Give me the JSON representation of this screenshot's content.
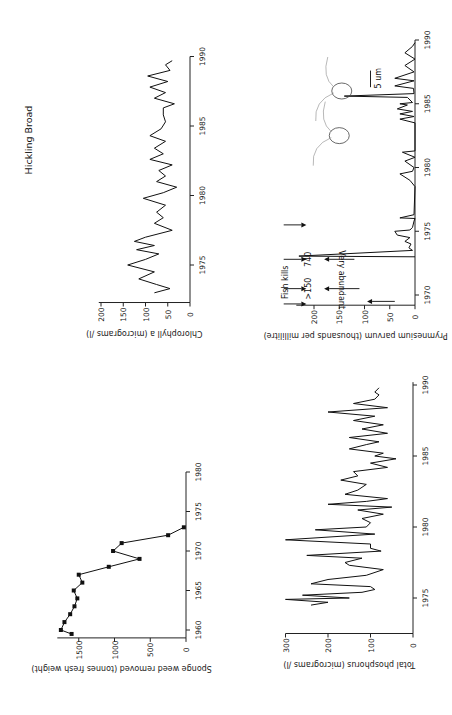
{
  "figure": {
    "title": "Hickling Broad",
    "orientation": "rotated 90 degrees counter-clockwise"
  },
  "chart_data": [
    {
      "id": "chlorophyll",
      "type": "line",
      "title": "",
      "xlabel": "",
      "ylabel": "Chlorophyll a (micrograms /l)",
      "x_ticks": [
        "1975",
        "1980",
        "1985",
        "1990"
      ],
      "y_ticks": [
        "0",
        "50",
        "100",
        "150",
        "200"
      ],
      "xlim": [
        1972,
        1990
      ],
      "ylim": [
        0,
        200
      ],
      "x": [
        1973.0,
        1973.3,
        1973.6,
        1974.0,
        1974.5,
        1975.0,
        1975.4,
        1975.8,
        1976.1,
        1976.4,
        1976.7,
        1977.0,
        1977.5,
        1978.0,
        1978.4,
        1978.8,
        1979.3,
        1979.8,
        1980.2,
        1980.6,
        1981.0,
        1981.4,
        1981.8,
        1982.2,
        1982.6,
        1983.0,
        1983.4,
        1983.9,
        1984.3,
        1984.8,
        1985.3,
        1985.8,
        1986.3,
        1986.6,
        1987.0,
        1987.4,
        1987.8,
        1988.2,
        1988.6,
        1989.0,
        1989.4,
        1989.7
      ],
      "values": [
        80,
        45,
        75,
        115,
        80,
        140,
        100,
        70,
        120,
        80,
        125,
        100,
        40,
        80,
        60,
        75,
        55,
        105,
        60,
        30,
        75,
        55,
        70,
        40,
        90,
        60,
        80,
        55,
        90,
        65,
        55,
        60,
        60,
        35,
        80,
        55,
        90,
        50,
        95,
        45,
        55,
        40
      ]
    },
    {
      "id": "prymnesium",
      "type": "line",
      "title": "",
      "xlabel": "",
      "ylabel": "Prymnesium parvum (thousands per millilitre)",
      "x_ticks": [
        "1970",
        "1975",
        "1980",
        "1985",
        "1990"
      ],
      "y_ticks": [
        "0",
        "50",
        "100",
        "150",
        "200"
      ],
      "xlim": [
        1969,
        1990
      ],
      "ylim": [
        0,
        200
      ],
      "x": [
        1973.0,
        1973.05,
        1973.5,
        1973.7,
        1974.0,
        1974.2,
        1974.5,
        1974.7,
        1975.0,
        1975.1,
        1975.3,
        1975.8,
        1976.0,
        1976.05,
        1976.3,
        1978.5,
        1979.0,
        1979.5,
        1979.7,
        1980.0,
        1980.5,
        1980.8,
        1981.2,
        1981.3,
        1983.5,
        1983.8,
        1984.0,
        1984.2,
        1984.4,
        1984.6,
        1984.9,
        1985.0,
        1985.1,
        1985.5,
        1985.6,
        1985.8,
        1986.2,
        1986.4,
        1986.8,
        1987.0,
        1987.5,
        1988.0,
        1988.5,
        1989.0,
        1989.5,
        1989.8
      ],
      "values": [
        0,
        230,
        5,
        12,
        8,
        20,
        10,
        35,
        40,
        10,
        5,
        2,
        0,
        30,
        2,
        0,
        10,
        30,
        5,
        2,
        20,
        0,
        25,
        0,
        0,
        30,
        2,
        30,
        5,
        35,
        15,
        30,
        5,
        15,
        140,
        2,
        3,
        40,
        2,
        40,
        2,
        20,
        0,
        20,
        5,
        0
      ],
      "annotations": [
        {
          "text": "Fish kills",
          "type": "label"
        },
        {
          "text": ">150",
          "x": 1970.5,
          "type": "value-label"
        },
        {
          "text": "740",
          "x": 1972.8,
          "type": "value-label"
        },
        {
          "text": "Very abundant",
          "x": 1969.5,
          "type": "value-label"
        },
        {
          "text": "Fish kill arrows",
          "x_values": [
            1969.3,
            1970.5,
            1972.8,
            1975.5
          ],
          "type": "arrows"
        },
        {
          "text": "5 um",
          "type": "scale-bar"
        }
      ]
    },
    {
      "id": "sponge-weed",
      "type": "line",
      "title": "",
      "xlabel": "",
      "ylabel": "Sponge weed removed (tonnes fresh weight)",
      "x_ticks": [
        "1960",
        "1965",
        "1970",
        "1975",
        "1980"
      ],
      "y_ticks": [
        "0",
        "500",
        "1000",
        "1500"
      ],
      "xlim": [
        1959,
        1980
      ],
      "ylim": [
        0,
        1800
      ],
      "x": [
        1959.5,
        1960,
        1961,
        1962,
        1963,
        1964,
        1965,
        1966,
        1967,
        1968,
        1969,
        1970,
        1971,
        1972,
        1973
      ],
      "values": [
        1600,
        1750,
        1700,
        1620,
        1560,
        1520,
        1570,
        1450,
        1500,
        1080,
        650,
        1020,
        900,
        250,
        30
      ],
      "markers": true
    },
    {
      "id": "phosphorus",
      "type": "line",
      "title": "",
      "xlabel": "",
      "ylabel": "Total phosphorus (micrograms /l)",
      "x_ticks": [
        "1975",
        "1980",
        "1985",
        "1990"
      ],
      "y_ticks": [
        "0",
        "100",
        "200",
        "300"
      ],
      "xlim": [
        1972.5,
        1990
      ],
      "ylim": [
        0,
        300
      ],
      "x": [
        1974.5,
        1974.7,
        1974.9,
        1975.0,
        1975.2,
        1975.4,
        1975.6,
        1975.8,
        1976.0,
        1976.3,
        1976.6,
        1977.0,
        1977.3,
        1977.5,
        1977.8,
        1978.0,
        1978.3,
        1978.5,
        1978.8,
        1979.1,
        1979.5,
        1979.8,
        1980.0,
        1980.3,
        1980.6,
        1980.9,
        1981.2,
        1981.4,
        1981.6,
        1981.8,
        1982.0,
        1982.3,
        1982.6,
        1983.0,
        1983.3,
        1983.6,
        1983.9,
        1984.2,
        1984.5,
        1984.8,
        1985.0,
        1985.2,
        1985.5,
        1985.8,
        1986.0,
        1986.3,
        1986.6,
        1986.9,
        1987.2,
        1987.5,
        1987.8,
        1988.1,
        1988.4,
        1988.7,
        1989.0,
        1989.3,
        1989.5,
        1989.8
      ],
      "values": [
        240,
        200,
        300,
        150,
        260,
        120,
        90,
        100,
        240,
        200,
        110,
        70,
        150,
        160,
        120,
        250,
        75,
        100,
        100,
        300,
        90,
        230,
        110,
        100,
        120,
        70,
        130,
        50,
        200,
        110,
        60,
        160,
        130,
        110,
        170,
        130,
        140,
        60,
        100,
        40,
        90,
        70,
        150,
        110,
        80,
        150,
        60,
        120,
        70,
        140,
        90,
        200,
        60,
        140,
        90,
        80,
        90,
        80
      ]
    }
  ]
}
